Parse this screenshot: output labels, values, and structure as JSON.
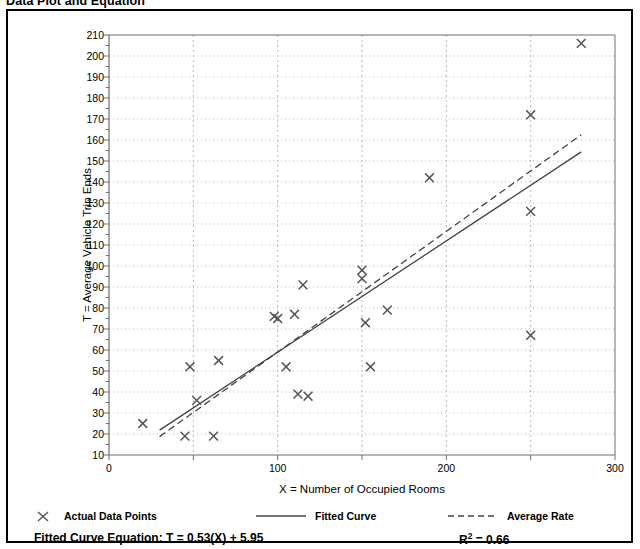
{
  "page": {
    "title": "Data Plot and Equation"
  },
  "chart_data": {
    "type": "scatter",
    "title": "Data Plot and Equation",
    "xlabel": "X = Number of Occupied Rooms",
    "ylabel": "T = Average Vehicle Trip Ends",
    "xlim": [
      0,
      300
    ],
    "ylim": [
      10,
      210
    ],
    "xticks": [
      0,
      100,
      200,
      300
    ],
    "xticks_minor": [
      50,
      150,
      250
    ],
    "yticks": [
      10,
      20,
      30,
      40,
      50,
      60,
      70,
      80,
      90,
      100,
      110,
      120,
      130,
      140,
      150,
      160,
      170,
      180,
      190,
      200,
      210
    ],
    "grid": true,
    "legend_position": "bottom",
    "series": [
      {
        "name": "Actual Data Points",
        "type": "scatter",
        "marker": "x",
        "color": "#555555",
        "points": [
          [
            20,
            25
          ],
          [
            45,
            19
          ],
          [
            48,
            52
          ],
          [
            52,
            36
          ],
          [
            62,
            19
          ],
          [
            65,
            55
          ],
          [
            98,
            76
          ],
          [
            100,
            75
          ],
          [
            105,
            52
          ],
          [
            110,
            77
          ],
          [
            112,
            39
          ],
          [
            115,
            91
          ],
          [
            118,
            38
          ],
          [
            150,
            98
          ],
          [
            150,
            94
          ],
          [
            152,
            73
          ],
          [
            155,
            52
          ],
          [
            165,
            79
          ],
          [
            190,
            142
          ],
          [
            250,
            172
          ],
          [
            250,
            126
          ],
          [
            250,
            67
          ],
          [
            280,
            206
          ]
        ]
      },
      {
        "name": "Fitted Curve",
        "type": "line",
        "style": "solid",
        "color": "#444444",
        "equation": "T = 0.53(X) + 5.95",
        "slope": 0.53,
        "intercept": 5.95,
        "x_range": [
          30,
          280
        ],
        "points": [
          [
            30,
            21.85
          ],
          [
            280,
            154.35
          ]
        ]
      },
      {
        "name": "Average Rate",
        "type": "line",
        "style": "dashed",
        "color": "#444444",
        "slope": 0.575,
        "intercept": 1.5,
        "x_range": [
          30,
          280
        ],
        "points": [
          [
            30,
            18.75
          ],
          [
            280,
            162.5
          ]
        ]
      }
    ],
    "r_squared": 0.66
  },
  "legend": {
    "items": [
      {
        "label": "Actual Data Points",
        "marker": "x-marker-icon"
      },
      {
        "label": "Fitted Curve",
        "marker": "solid-line-icon"
      },
      {
        "label": "Average Rate",
        "marker": "dashed-line-icon"
      }
    ]
  },
  "footer": {
    "equation_label": "Fitted Curve Equation:",
    "equation_value": "T = 0.53(X) + 5.95",
    "r2_prefix": "R",
    "r2_exponent": "2",
    "r2_value": " = 0.66"
  },
  "colors": {
    "frame": "#000000",
    "axis": "#6f6f6f",
    "grid": "#b8b8b8",
    "marker": "#555555",
    "line": "#444444"
  }
}
